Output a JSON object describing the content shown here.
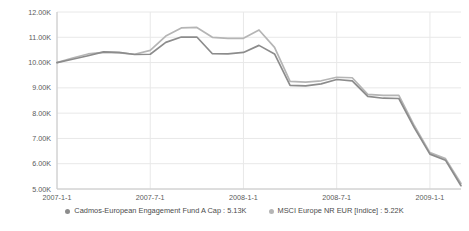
{
  "chart_data": {
    "type": "line",
    "title": "",
    "xlabel": "",
    "ylabel": "",
    "grid": true,
    "legend_position": "bottom-center",
    "ylim": [
      5000,
      12000
    ],
    "yticks": [
      5000,
      6000,
      7000,
      8000,
      9000,
      10000,
      11000,
      12000
    ],
    "ytick_labels": [
      "5.00K",
      "6.00K",
      "7.00K",
      "8.00K",
      "9.00K",
      "10.00K",
      "11.00K",
      "12.00K"
    ],
    "xticks": [
      "2007-1-1",
      "2007-7-1",
      "2008-1-1",
      "2008-7-1",
      "2009-1-1"
    ],
    "xtick_labels": [
      "2007-1-1",
      "2007-7-1",
      "2008-1-1",
      "2008-7-1",
      "2009-1-1"
    ],
    "x": [
      "2007-1-1",
      "2007-2-1",
      "2007-3-1",
      "2007-4-1",
      "2007-5-1",
      "2007-6-1",
      "2007-7-1",
      "2007-8-1",
      "2007-9-1",
      "2007-10-1",
      "2007-11-1",
      "2007-12-1",
      "2008-1-1",
      "2008-2-1",
      "2008-3-1",
      "2008-4-1",
      "2008-5-1",
      "2008-6-1",
      "2008-7-1",
      "2008-8-1",
      "2008-9-1",
      "2008-10-1",
      "2008-11-1",
      "2008-12-1",
      "2009-1-1",
      "2009-2-1",
      "2009-3-1"
    ],
    "series": [
      {
        "name": "Cadmos-European Engagement Fund A Cap",
        "color": "#8c8c8c",
        "last_value_label": "5.13K",
        "values": [
          10000,
          10130,
          10270,
          10420,
          10400,
          10320,
          10330,
          10800,
          11010,
          11010,
          10350,
          10340,
          10400,
          10680,
          10340,
          9100,
          9080,
          9160,
          9330,
          9280,
          8660,
          8590,
          8580,
          7420,
          6380,
          6140,
          5130
        ]
      },
      {
        "name": "MSCI Europe NR EUR [Indice]",
        "color": "#b5b5b5",
        "last_value_label": "5.22K",
        "values": [
          10000,
          10180,
          10340,
          10400,
          10380,
          10330,
          10480,
          11050,
          11370,
          11390,
          11000,
          10960,
          10960,
          11290,
          10600,
          9260,
          9230,
          9280,
          9420,
          9400,
          8740,
          8700,
          8700,
          7500,
          6440,
          6200,
          5220
        ]
      }
    ]
  },
  "legend": {
    "items": [
      {
        "label": "Cadmos-European Engagement Fund A Cap : 5.13K",
        "color": "#8c8c8c"
      },
      {
        "label": "MSCI Europe NR EUR [Indice] : 5.22K",
        "color": "#b5b5b5"
      }
    ]
  }
}
